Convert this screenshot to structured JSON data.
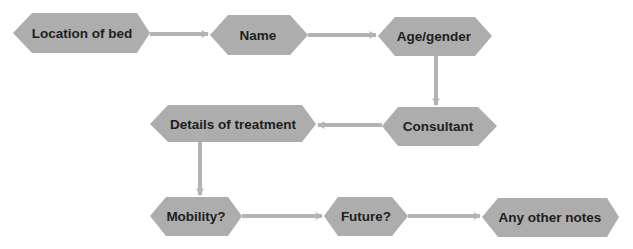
{
  "diagram": {
    "colors": {
      "node_fill": "#adadad",
      "connector": "#b3b3b3",
      "text": "#1e1e1e",
      "background": "#ffffff"
    },
    "nodes": [
      {
        "id": "location",
        "label": "Location of bed"
      },
      {
        "id": "name",
        "label": "Name"
      },
      {
        "id": "age",
        "label": "Age/gender"
      },
      {
        "id": "consultant",
        "label": "Consultant"
      },
      {
        "id": "details",
        "label": "Details of treatment"
      },
      {
        "id": "mobility",
        "label": "Mobility?"
      },
      {
        "id": "future",
        "label": "Future?"
      },
      {
        "id": "notes",
        "label": "Any other notes"
      }
    ],
    "edges": [
      {
        "from": "location",
        "to": "name"
      },
      {
        "from": "name",
        "to": "age"
      },
      {
        "from": "age",
        "to": "consultant"
      },
      {
        "from": "consultant",
        "to": "details"
      },
      {
        "from": "details",
        "to": "mobility"
      },
      {
        "from": "mobility",
        "to": "future"
      },
      {
        "from": "future",
        "to": "notes"
      }
    ]
  }
}
